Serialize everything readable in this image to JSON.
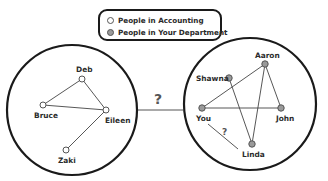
{
  "legend": {
    "items": [
      {
        "label": "People in Accounting",
        "fill": "#ffffff",
        "stroke": "#555555"
      },
      {
        "label": "People in Your Department",
        "fill": "#9a9a9a",
        "stroke": "#555555"
      }
    ]
  },
  "colors": {
    "outline": "#1a1a1a",
    "edge": "#444444",
    "accounting_node_fill": "#ffffff",
    "department_node_fill": "#9a9a9a",
    "node_stroke": "#555555"
  },
  "groups": [
    {
      "name": "People in Accounting",
      "nodes": [
        {
          "id": "deb",
          "label": "Deb"
        },
        {
          "id": "bruce",
          "label": "Bruce"
        },
        {
          "id": "eileen",
          "label": "Eileen"
        },
        {
          "id": "zaki",
          "label": "Zaki"
        }
      ],
      "edges": [
        [
          "deb",
          "bruce"
        ],
        [
          "deb",
          "eileen"
        ],
        [
          "bruce",
          "eileen"
        ],
        [
          "eileen",
          "zaki"
        ]
      ]
    },
    {
      "name": "People in Your Department",
      "nodes": [
        {
          "id": "aaron",
          "label": "Aaron"
        },
        {
          "id": "shawna",
          "label": "Shawna"
        },
        {
          "id": "you",
          "label": "You"
        },
        {
          "id": "john",
          "label": "John"
        },
        {
          "id": "linda",
          "label": "Linda"
        }
      ],
      "edges": [
        [
          "aaron",
          "you"
        ],
        [
          "aaron",
          "john"
        ],
        [
          "aaron",
          "linda"
        ],
        [
          "shawna",
          "linda"
        ],
        [
          "you",
          "john"
        ]
      ],
      "uncertain_edges": [
        [
          "you",
          "linda"
        ]
      ]
    }
  ],
  "between_groups": {
    "label": "?"
  },
  "you_linda_link": {
    "label": "?"
  }
}
